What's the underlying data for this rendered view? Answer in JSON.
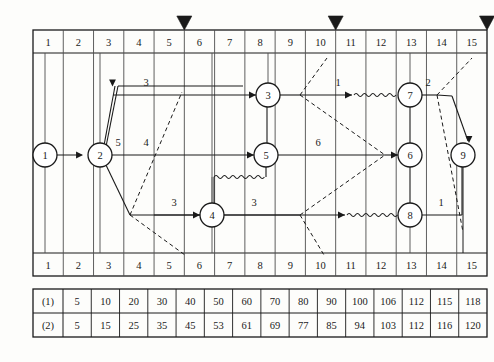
{
  "diagram": {
    "time_axis": {
      "top_labels": [
        "1",
        "2",
        "3",
        "4",
        "5",
        "6",
        "7",
        "8",
        "9",
        "10",
        "11",
        "12",
        "13",
        "14",
        "15"
      ],
      "bottom_labels": [
        "1",
        "2",
        "3",
        "4",
        "5",
        "6",
        "7",
        "8",
        "9",
        "10",
        "11",
        "12",
        "13",
        "14",
        "15"
      ],
      "unit_count": 15
    },
    "markers": [
      {
        "name": "checkpoint-marker-1",
        "after_unit": 5,
        "glyph": "▼"
      },
      {
        "name": "checkpoint-marker-2",
        "after_unit": 10,
        "glyph": "▼"
      },
      {
        "name": "checkpoint-marker-3",
        "after_unit": 15,
        "glyph": "▼"
      }
    ],
    "nodes": [
      {
        "id": "1",
        "label": "1",
        "x": 45,
        "y": 155
      },
      {
        "id": "2",
        "label": "2",
        "x": 100,
        "y": 155
      },
      {
        "id": "3",
        "label": "3",
        "x": 268,
        "y": 95
      },
      {
        "id": "4",
        "label": "4",
        "x": 212,
        "y": 215
      },
      {
        "id": "5",
        "label": "5",
        "x": 266,
        "y": 155
      },
      {
        "id": "6",
        "label": "6",
        "x": 410,
        "y": 155
      },
      {
        "id": "7",
        "label": "7",
        "x": 410,
        "y": 95
      },
      {
        "id": "8",
        "label": "8",
        "x": 410,
        "y": 215
      },
      {
        "id": "9",
        "label": "9",
        "x": 463,
        "y": 155
      }
    ],
    "activity_durations": [
      {
        "name": "duration-1-2",
        "label": "5",
        "x": 118,
        "y": 146
      },
      {
        "name": "duration-2-3",
        "label": "3",
        "x": 146,
        "y": 86
      },
      {
        "name": "duration-2-5",
        "label": "4",
        "x": 146,
        "y": 146
      },
      {
        "name": "duration-2-4",
        "label": "3",
        "x": 174,
        "y": 206
      },
      {
        "name": "duration-4-6",
        "label": "3",
        "x": 254,
        "y": 206
      },
      {
        "name": "duration-5-6",
        "label": "6",
        "x": 318,
        "y": 146
      },
      {
        "name": "duration-3-7",
        "label": "1",
        "x": 338,
        "y": 86
      },
      {
        "name": "duration-7-9",
        "label": "2",
        "x": 428,
        "y": 86
      },
      {
        "name": "duration-8-9",
        "label": "1",
        "x": 441,
        "y": 206
      }
    ]
  },
  "summary_table": {
    "rows": [
      {
        "label": "(1)",
        "values": [
          "5",
          "10",
          "20",
          "30",
          "40",
          "50",
          "60",
          "70",
          "80",
          "90",
          "100",
          "106",
          "112",
          "115",
          "118"
        ]
      },
      {
        "label": "(2)",
        "values": [
          "5",
          "15",
          "25",
          "35",
          "45",
          "53",
          "61",
          "69",
          "77",
          "85",
          "94",
          "103",
          "112",
          "116",
          "120"
        ]
      }
    ]
  },
  "style": {
    "line_color": "#1a1a1a",
    "grid_color": "#4d4d4d",
    "background": "#fdfdfb"
  }
}
